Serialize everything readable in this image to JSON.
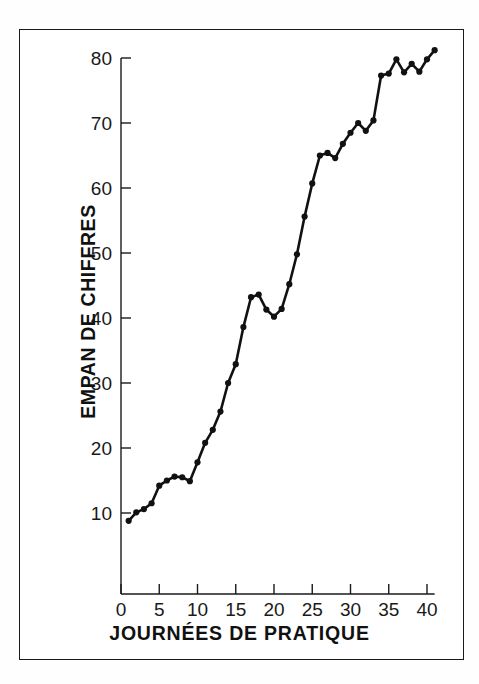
{
  "figure": {
    "background": "#ffffff",
    "frame_color": "#1a1a1a",
    "line_color": "#111111",
    "marker_color": "#111111"
  },
  "axis": {
    "y_label": "EMPAN DE CHIFFRES",
    "x_label": "JOURNÉES DE PRATIQUE",
    "y_ticks": [
      "10",
      "20",
      "30",
      "40",
      "50",
      "60",
      "70",
      "80"
    ],
    "x_ticks": [
      "0",
      "5",
      "10",
      "15",
      "20",
      "25",
      "30",
      "35",
      "40"
    ]
  },
  "chart_data": {
    "type": "line",
    "title": "",
    "xlabel": "JOURNÉES DE PRATIQUE",
    "ylabel": "EMPAN DE CHIFFRES",
    "xlim": [
      0,
      41
    ],
    "ylim": [
      1.5,
      84
    ],
    "grid": false,
    "legend": "none",
    "markers": true,
    "xticks": [
      0,
      5,
      10,
      15,
      20,
      25,
      30,
      35,
      40
    ],
    "yticks": [
      10,
      20,
      30,
      40,
      50,
      60,
      70,
      80
    ],
    "x": [
      1,
      2,
      3,
      4,
      5,
      6,
      7,
      8,
      9,
      10,
      11,
      12,
      13,
      14,
      15,
      16,
      17,
      18,
      19,
      20,
      21,
      22,
      23,
      24,
      25,
      26,
      27,
      28,
      29,
      30,
      31,
      32,
      33,
      34,
      35,
      36,
      37,
      38,
      39,
      40,
      41
    ],
    "values": [
      8.8,
      10.1,
      10.6,
      11.5,
      14.2,
      15.0,
      15.6,
      15.5,
      14.9,
      17.8,
      20.8,
      22.8,
      25.6,
      30.0,
      32.9,
      38.6,
      43.2,
      43.6,
      41.3,
      40.2,
      41.4,
      45.2,
      49.8,
      55.6,
      60.7,
      65.0,
      65.4,
      64.6,
      66.8,
      68.5,
      70.0,
      68.8,
      70.4,
      77.3,
      77.6,
      79.8,
      77.8,
      79.1,
      77.9,
      79.8,
      81.2
    ],
    "series": [
      {
        "name": "empan de chiffres",
        "values": [
          8.8,
          10.1,
          10.6,
          11.5,
          14.2,
          15.0,
          15.6,
          15.5,
          14.9,
          17.8,
          20.8,
          22.8,
          25.6,
          30.0,
          32.9,
          38.6,
          43.2,
          43.6,
          41.3,
          40.2,
          41.4,
          45.2,
          49.8,
          55.6,
          60.7,
          65.0,
          65.4,
          64.6,
          66.8,
          68.5,
          70.0,
          68.8,
          70.4,
          77.3,
          77.6,
          79.8,
          77.8,
          79.1,
          77.9,
          79.8,
          81.2
        ]
      }
    ]
  }
}
